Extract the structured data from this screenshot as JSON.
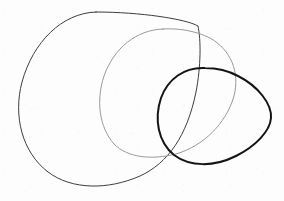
{
  "figure": {
    "background_color": "#fdfdfd",
    "width": 284,
    "height": 201,
    "shape_count": "3"
  },
  "shapes": [
    {
      "name": "large-left-oval",
      "description": "Large hand-drawn oval, leftmost and largest, tapering to a point at upper right",
      "stroke_color": "#3d3d3d",
      "stroke_width": "1",
      "bounds": {
        "x_min": 20,
        "x_max": 200,
        "y_min": 12,
        "y_max": 188
      },
      "path": "M 96 12 C 62 13, 33 42, 22 82 C 13 116, 22 152, 48 172 C 72 190, 108 190, 140 176 C 168 163, 187 136, 196 92 C 201 66, 201 40, 198 26 C 186 19, 140 12, 96 12 Z"
    },
    {
      "name": "middle-gray-oval",
      "description": "Medium light-gray oval overlapping the large oval on its right half",
      "stroke_color": "#9a9a9a",
      "stroke_width": "1",
      "bounds": {
        "x_min": 100,
        "x_max": 236,
        "y_min": 28,
        "y_max": 158
      },
      "path": "M 163 29 C 136 30, 114 48, 104 76 C 96 100, 99 127, 114 144 C 128 158, 152 160, 176 154 C 203 146, 226 124, 234 96 C 240 72, 231 50, 210 38 C 196 31, 179 28, 163 29 Z"
    },
    {
      "name": "bold-right-oval",
      "description": "Bold near-black egg-shaped curve at the right, bulging toward the lower right",
      "stroke_color": "#141414",
      "stroke_width": "2",
      "bounds": {
        "x_min": 158,
        "x_max": 272,
        "y_min": 67,
        "y_max": 165
      },
      "path": "M 205 68 C 184 67, 168 79, 161 98 C 154 119, 158 142, 174 155 C 190 167, 214 167, 236 156 C 256 146, 270 131, 271 118 C 272 104, 258 86, 238 76 C 227 70, 216 68, 205 68 Z"
    }
  ],
  "palette": {
    "background": "#fdfdfd",
    "dark_stroke": "#141414",
    "mid_stroke": "#3d3d3d",
    "light_stroke": "#9a9a9a"
  }
}
